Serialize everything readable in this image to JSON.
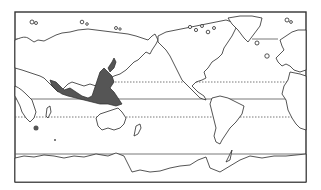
{
  "figure": {
    "type": "world-map",
    "projection": "equirectangular (Pacific-centered)",
    "frame": {
      "x": 15,
      "y": 12,
      "width": 291,
      "height": 170
    },
    "colors": {
      "background": "#ffffff",
      "outline": "#2a2a2a",
      "shaded_region": "#555555",
      "latitude_lines": "#555555"
    },
    "latitude_lines": [
      {
        "name": "Arctic Circle",
        "style": "solid",
        "y": 39
      },
      {
        "name": "Tropic of Cancer",
        "style": "dotted",
        "y": 82
      },
      {
        "name": "Equator",
        "style": "solid",
        "y": 99
      },
      {
        "name": "Tropic of Capricorn",
        "style": "dotted",
        "y": 117
      },
      {
        "name": "Antarctic Circle",
        "style": "solid",
        "y": 154
      }
    ],
    "shaded_regions": [
      "Indo-Pacific coastal band (India to Indonesia, Philippines, southern China, Japan)",
      "Northern Australia coast",
      "Madagascar area spot"
    ],
    "text_labels": []
  }
}
